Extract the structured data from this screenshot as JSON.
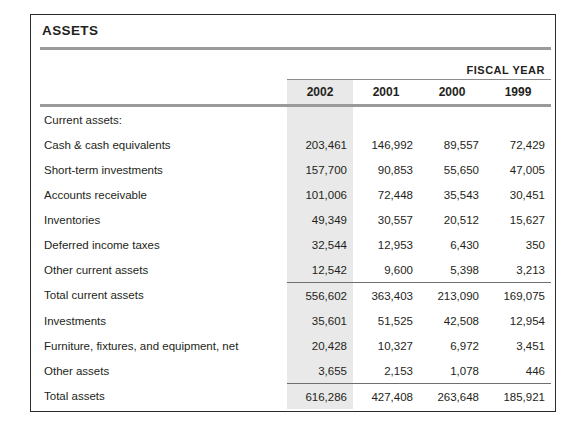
{
  "document": {
    "title": "ASSETS"
  },
  "table": {
    "group_header": "FISCAL YEAR",
    "label_column_header": "",
    "year_columns": [
      "2002",
      "2001",
      "2000",
      "1999"
    ],
    "shaded_column": "2002",
    "shaded_column_color": "#e9e9e9",
    "rows": [
      {
        "label": "Current assets:",
        "indent": 0,
        "values": [
          "",
          "",
          "",
          ""
        ],
        "rule_above": false,
        "total": false
      },
      {
        "label": "Cash & cash equivalents",
        "indent": 1,
        "values": [
          "203,461",
          "146,992",
          "89,557",
          "72,429"
        ],
        "rule_above": false,
        "total": false
      },
      {
        "label": "Short-term investments",
        "indent": 1,
        "values": [
          "157,700",
          "90,853",
          "55,650",
          "47,005"
        ],
        "rule_above": false,
        "total": false
      },
      {
        "label": "Accounts receivable",
        "indent": 1,
        "values": [
          "101,006",
          "72,448",
          "35,543",
          "30,451"
        ],
        "rule_above": false,
        "total": false
      },
      {
        "label": "Inventories",
        "indent": 1,
        "values": [
          "49,349",
          "30,557",
          "20,512",
          "15,627"
        ],
        "rule_above": false,
        "total": false
      },
      {
        "label": "Deferred income taxes",
        "indent": 1,
        "values": [
          "32,544",
          "12,953",
          "6,430",
          "350"
        ],
        "rule_above": false,
        "total": false
      },
      {
        "label": "Other current assets",
        "indent": 1,
        "values": [
          "12,542",
          "9,600",
          "5,398",
          "3,213"
        ],
        "rule_above": false,
        "total": false
      },
      {
        "label": "Total current assets",
        "indent": 2,
        "values": [
          "556,602",
          "363,403",
          "213,090",
          "169,075"
        ],
        "rule_above": true,
        "total": true
      },
      {
        "label": "Investments",
        "indent": 0,
        "values": [
          "35,601",
          "51,525",
          "42,508",
          "12,954"
        ],
        "rule_above": false,
        "total": false
      },
      {
        "label": "Furniture, fixtures, and equipment, net",
        "indent": 0,
        "values": [
          "20,428",
          "10,327",
          "6,972",
          "3,451"
        ],
        "rule_above": false,
        "total": false
      },
      {
        "label": "Other assets",
        "indent": 0,
        "values": [
          "3,655",
          "2,153",
          "1,078",
          "446"
        ],
        "rule_above": false,
        "total": false
      },
      {
        "label": "Total assets",
        "indent": 2,
        "values": [
          "616,286",
          "427,408",
          "263,648",
          "185,921"
        ],
        "rule_above": true,
        "total": true
      }
    ]
  }
}
